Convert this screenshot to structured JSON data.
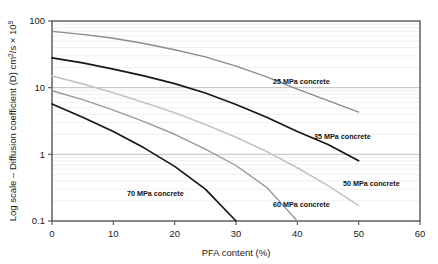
{
  "chart_data": {
    "type": "line",
    "title": "",
    "xlabel": "PFA content (%)",
    "ylabel": "Log scale – Diffusion coefficient (D) cm²/s × 10⁹",
    "ylabel_parts": {
      "main": "Log scale – Diffusion coefficient (D) cm",
      "sup1": "2",
      "mid": "/s × 10",
      "sup2": "9"
    },
    "xlim": [
      0,
      60
    ],
    "ylim": [
      0.1,
      100
    ],
    "yscale": "log",
    "xscale": "linear",
    "grid": true,
    "grid_minor": true,
    "legend": "inline-annotations",
    "xticks": [
      "0",
      "10",
      "20",
      "30",
      "40",
      "50",
      "60"
    ],
    "xtick_values": [
      0,
      10,
      20,
      30,
      40,
      50,
      60
    ],
    "yticks": [
      "100",
      "10",
      "1",
      "0.1"
    ],
    "ytick_values": [
      100,
      10,
      1,
      0.1
    ],
    "series": [
      {
        "name": "25 MPa concrete",
        "label": "25 MPa concrete",
        "color": "#8c8c8c",
        "width": 1.4,
        "label_x": 273,
        "label_y": 84,
        "x": [
          0,
          5,
          10,
          15,
          20,
          25,
          30,
          35,
          40,
          45,
          50
        ],
        "y": [
          70,
          63,
          55,
          46,
          37,
          29,
          21,
          14.5,
          9.5,
          6.4,
          4.3
        ]
      },
      {
        "name": "35 MPa concrete",
        "label": "35 MPa concrete",
        "color": "#171717",
        "width": 1.7,
        "label_x": 314,
        "label_y": 139,
        "x": [
          0,
          5,
          10,
          15,
          20,
          25,
          30,
          35,
          40,
          45,
          50
        ],
        "y": [
          28,
          23.5,
          19,
          15,
          11.5,
          8.3,
          5.6,
          3.6,
          2.2,
          1.4,
          0.8
        ]
      },
      {
        "name": "50 MPa concrete",
        "label": "50 MPa concrete",
        "color": "#c4c4c4",
        "width": 1.6,
        "label_x": 343,
        "label_y": 186,
        "x": [
          0,
          5,
          10,
          15,
          20,
          25,
          30,
          35,
          40,
          45,
          50
        ],
        "y": [
          15,
          11.4,
          8.4,
          6.0,
          4.2,
          2.8,
          1.8,
          1.1,
          0.63,
          0.34,
          0.17
        ]
      },
      {
        "name": "60 MPa concrete",
        "label": "60 MPa concrete",
        "color": "#9a9a9a",
        "width": 1.4,
        "label_x": 273,
        "label_y": 207,
        "x": [
          0,
          5,
          10,
          15,
          20,
          25,
          30,
          35,
          40
        ],
        "y": [
          9.0,
          6.6,
          4.6,
          3.1,
          2.0,
          1.2,
          0.68,
          0.32,
          0.1
        ]
      },
      {
        "name": "70 MPa concrete",
        "label": "70 MPa concrete",
        "color": "#171717",
        "width": 1.7,
        "label_x": 127,
        "label_y": 196,
        "x": [
          0,
          5,
          10,
          15,
          20,
          25,
          30
        ],
        "y": [
          5.7,
          3.6,
          2.2,
          1.25,
          0.66,
          0.3,
          0.1
        ]
      }
    ],
    "colors": {
      "axis": "#555555",
      "grid_major": "#b8b8b8",
      "grid_minor": "#e8e8e8",
      "text": "#1a1a1a",
      "background": "#ffffff"
    }
  }
}
